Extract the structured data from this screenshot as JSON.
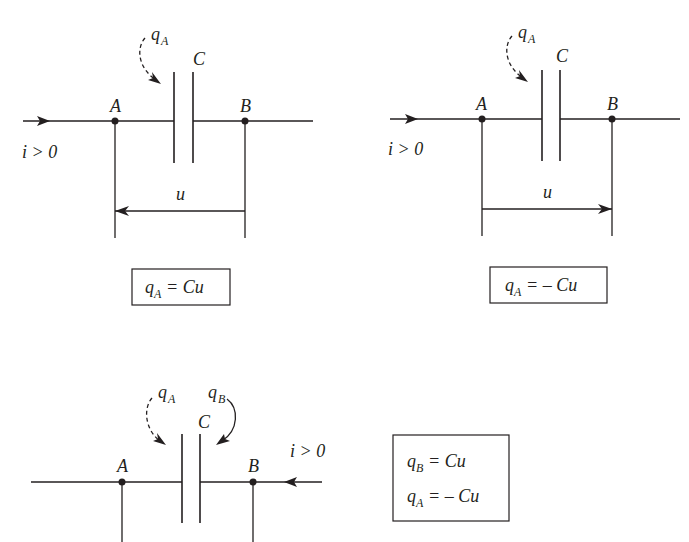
{
  "figure": {
    "diagrams": [
      {
        "id": "top-left",
        "current_label": "i > 0",
        "current_direction": "left-to-right",
        "node_a_label": "A",
        "node_b_label": "B",
        "capacitor_label": "C",
        "charge_label": {
          "q": "q",
          "sub": "A"
        },
        "voltage_label": "u",
        "voltage_arrow_direction": "B-to-A",
        "formula": {
          "lhs_q": "q",
          "lhs_sub": "A",
          "rhs": "= Cu"
        }
      },
      {
        "id": "top-right",
        "current_label": "i > 0",
        "current_direction": "left-to-right",
        "node_a_label": "A",
        "node_b_label": "B",
        "capacitor_label": "C",
        "charge_label": {
          "q": "q",
          "sub": "A"
        },
        "voltage_label": "u",
        "voltage_arrow_direction": "A-to-B",
        "formula": {
          "lhs_q": "q",
          "lhs_sub": "A",
          "rhs": "= – Cu"
        }
      },
      {
        "id": "bottom",
        "current_label": "i > 0",
        "current_direction": "right-to-left",
        "node_a_label": "A",
        "node_b_label": "B",
        "capacitor_label": "C",
        "charge_label_a": {
          "q": "q",
          "sub": "A"
        },
        "charge_label_b": {
          "q": "q",
          "sub": "B"
        },
        "formula_lines": [
          {
            "lhs_q": "q",
            "lhs_sub": "B",
            "rhs": "= Cu"
          },
          {
            "lhs_q": "q",
            "lhs_sub": "A",
            "rhs": "= – Cu"
          }
        ]
      }
    ],
    "colors": {
      "ink": "#231f20",
      "background": "#ffffff"
    }
  }
}
